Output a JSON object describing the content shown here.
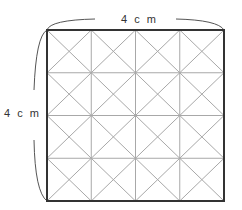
{
  "diagram": {
    "top_label": "4 c m",
    "left_label": "4 c m",
    "grid": {
      "rows": 4,
      "cols": 4,
      "diagonals": true
    },
    "colors": {
      "border": "#333333",
      "grid": "#a8a8a8",
      "brace": "#555555"
    }
  }
}
